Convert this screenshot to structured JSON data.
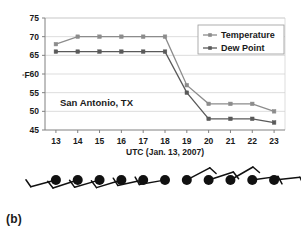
{
  "figure": {
    "caption": "(b)",
    "annotation": "San Antonio, TX"
  },
  "chart_data": {
    "type": "line",
    "title": "",
    "subtitle": "",
    "xlabel": "UTC (Jan. 13, 2007)",
    "ylabel": "°F",
    "x": [
      13,
      14,
      15,
      16,
      17,
      18,
      19,
      20,
      21,
      22,
      23
    ],
    "categories": [
      "13",
      "14",
      "15",
      "16",
      "17",
      "18",
      "19",
      "20",
      "21",
      "22",
      "23"
    ],
    "xlim": [
      12.5,
      23.5
    ],
    "ylim": [
      45,
      75
    ],
    "yticks": [
      45,
      50,
      55,
      60,
      65,
      70,
      75
    ],
    "ytick_labels": [
      "45",
      "50",
      "55",
      "60",
      "65",
      "70",
      "75"
    ],
    "xtick_labels": [
      "13",
      "14",
      "15",
      "16",
      "17",
      "18",
      "19",
      "20",
      "21",
      "22",
      "23"
    ],
    "grid": "horizontal",
    "legend_position": "top-right",
    "series": [
      {
        "name": "Temperature",
        "color": "#8c8c8c",
        "marker": "square",
        "values": [
          68,
          70,
          70,
          70,
          70,
          70,
          57,
          52,
          52,
          52,
          50
        ]
      },
      {
        "name": "Dew Point",
        "color": "#5a5a5a",
        "marker": "square",
        "values": [
          66,
          66,
          66,
          66,
          66,
          66,
          55,
          48,
          48,
          48,
          47
        ]
      }
    ],
    "annotations": [
      {
        "text": "San Antonio, TX",
        "x": 14.1,
        "y": 52.2
      }
    ]
  },
  "wind_barbs": {
    "label": "wind-barb-row",
    "count": 11,
    "barbs": [
      {
        "hour": "13",
        "direction": "south-southwest",
        "shaft_angle_deg": 195,
        "flags": 1
      },
      {
        "hour": "14",
        "direction": "south-southwest",
        "shaft_angle_deg": 198,
        "flags": 1
      },
      {
        "hour": "15",
        "direction": "south-southwest",
        "shaft_angle_deg": 196,
        "flags": 1
      },
      {
        "hour": "16",
        "direction": "south-southwest",
        "shaft_angle_deg": 197,
        "flags": 1
      },
      {
        "hour": "17",
        "direction": "south",
        "shaft_angle_deg": 192,
        "flags": 1
      },
      {
        "hour": "18",
        "direction": "south",
        "shaft_angle_deg": 190,
        "flags": 1
      },
      {
        "hour": "19",
        "direction": "north-northwest",
        "shaft_angle_deg": 28,
        "flags": 1
      },
      {
        "hour": "20",
        "direction": "north-northwest",
        "shaft_angle_deg": 18,
        "flags": 1
      },
      {
        "hour": "21",
        "direction": "north-northwest",
        "shaft_angle_deg": 30,
        "flags": 1
      },
      {
        "hour": "22",
        "direction": "north",
        "shaft_angle_deg": 8,
        "flags": 1
      },
      {
        "hour": "23",
        "direction": "north",
        "shaft_angle_deg": 6,
        "flags": 1
      }
    ]
  },
  "colors": {
    "temperature": "#8c8c8c",
    "dew_point": "#5a5a5a",
    "axis": "#808080",
    "grid": "#cfcfcf",
    "text": "#1a1a1a",
    "barb": "#111111",
    "background": "#ffffff"
  }
}
